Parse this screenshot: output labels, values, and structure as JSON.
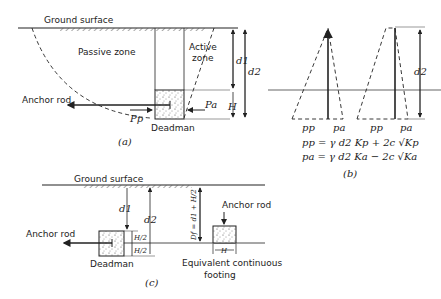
{
  "figure": {
    "part_a": {
      "ground_surface": "Ground surface",
      "passive_zone": "Passive zone",
      "active_zone_1": "Active",
      "active_zone_2": "zone",
      "anchor_rod": "Anchor rod",
      "deadman": "Deadman",
      "Pp": "Pp",
      "Pa": "Pa",
      "d1": "d1",
      "d2": "d2",
      "H": "H",
      "caption": "(a)"
    },
    "part_b": {
      "pp_label_1": "pp",
      "pa_label_1": "pa",
      "pp_label_2": "pp",
      "pa_label_2": "pa",
      "d2": "d2",
      "eq1": "pp = γ d2 Kp + 2c √Kp",
      "eq2": "pa = γ d2 Ka − 2c √Ka",
      "caption": "(b)"
    },
    "part_c": {
      "ground_surface": "Ground surface",
      "anchor_rod_left": "Anchor rod",
      "anchor_rod_right": "Anchor rod",
      "deadman": "Deadman",
      "d1": "d1",
      "d2": "d2",
      "H_half_1": "H/2",
      "H_half_2": "H/2",
      "Df": "Df = d1 + H/2",
      "H": "H",
      "footing_1": "Equivalent continuous",
      "footing_2": "footing",
      "caption": "(c)"
    }
  }
}
